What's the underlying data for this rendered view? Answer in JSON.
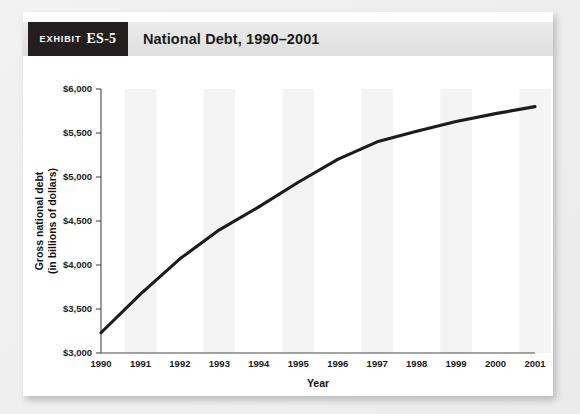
{
  "exhibit": {
    "kicker": "Exhibit",
    "number": "ES-5",
    "title": "National Debt, 1990–2001"
  },
  "chart_data": {
    "type": "line",
    "title": "National Debt, 1990–2001",
    "xlabel": "Year",
    "ylabel": "Gross national debt\n(in billions of dollars)",
    "ylabel_line1": "Gross national debt",
    "ylabel_line2": "(in billions of dollars)",
    "categories": [
      "1990",
      "1991",
      "1992",
      "1993",
      "1994",
      "1995",
      "1996",
      "1997",
      "1998",
      "1999",
      "2000",
      "2001"
    ],
    "x": [
      1990,
      1991,
      1992,
      1993,
      1994,
      1995,
      1996,
      1997,
      1998,
      1999,
      2000,
      2001
    ],
    "values": [
      3230,
      3670,
      4070,
      4400,
      4660,
      4940,
      5200,
      5400,
      5520,
      5630,
      5720,
      5800
    ],
    "series": [
      {
        "name": "Gross national debt",
        "values": [
          3230,
          3670,
          4070,
          4400,
          4660,
          4940,
          5200,
          5400,
          5520,
          5630,
          5720,
          5800
        ]
      }
    ],
    "ylim": [
      3000,
      6000
    ],
    "ytick_values": [
      3000,
      3500,
      4000,
      4500,
      5000,
      5500,
      6000
    ],
    "ytick_labels": [
      "$3,000",
      "$3,500",
      "$4,000",
      "$4,500",
      "$5,000",
      "$5,500",
      "$6,000"
    ],
    "xlim": [
      1990,
      2001
    ],
    "grid": false,
    "legend": null,
    "line_color": "#1c1c1c",
    "band_color": "#f4f4f4",
    "units": "billions of dollars"
  },
  "colors": {
    "badge_background": "#231f20",
    "header_band": "#e6e6e6",
    "card": "#ffffff",
    "page_background": "#efefef",
    "line": "#1c1c1c",
    "axis": "#4a4a4a"
  }
}
